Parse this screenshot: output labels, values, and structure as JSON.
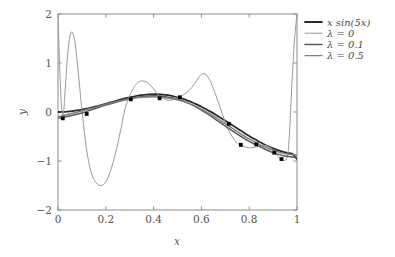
{
  "chart_data": {
    "type": "line",
    "title": "",
    "xlabel": "x",
    "ylabel": "y",
    "xlim": [
      0,
      1
    ],
    "ylim": [
      -2,
      2
    ],
    "xticks": [
      0,
      0.2,
      0.4,
      0.6,
      0.8,
      1
    ],
    "xticklabels": [
      "0",
      "0.2",
      "0.4",
      "0.6",
      "0.8",
      "1"
    ],
    "yticks": [
      -2,
      -1,
      0,
      1,
      2
    ],
    "yticklabels": [
      "-2",
      "-1",
      "0",
      "1",
      "2"
    ],
    "grid": false,
    "legend_position": "outside right top",
    "legend_entries": [
      "x sin(5x)",
      "λ = 0",
      "λ = 0.1",
      "λ = 0.5"
    ],
    "series": [
      {
        "name": "x sin(5x)",
        "color": "#2b2b2b",
        "linewidth": 1.8,
        "x": [
          0.0,
          0.02,
          0.04,
          0.06,
          0.08,
          0.1,
          0.12,
          0.14,
          0.16,
          0.18,
          0.2,
          0.22,
          0.24,
          0.26,
          0.28,
          0.3,
          0.32,
          0.34,
          0.36,
          0.38,
          0.4,
          0.42,
          0.44,
          0.46,
          0.48,
          0.5,
          0.52,
          0.54,
          0.56,
          0.58,
          0.6,
          0.62,
          0.64,
          0.66,
          0.68,
          0.7,
          0.72,
          0.74,
          0.76,
          0.78,
          0.8,
          0.82,
          0.84,
          0.86,
          0.88,
          0.9,
          0.92,
          0.94,
          0.96,
          0.98,
          1.0
        ],
        "y": [
          0.0,
          0.002,
          0.008,
          0.018,
          0.031,
          0.048,
          0.068,
          0.09,
          0.114,
          0.14,
          0.168,
          0.196,
          0.224,
          0.251,
          0.277,
          0.3,
          0.321,
          0.338,
          0.351,
          0.359,
          0.363,
          0.362,
          0.355,
          0.343,
          0.326,
          0.3,
          0.272,
          0.238,
          0.199,
          0.156,
          0.108,
          0.057,
          0.002,
          -0.056,
          -0.116,
          -0.177,
          -0.24,
          -0.303,
          -0.366,
          -0.428,
          -0.488,
          -0.546,
          -0.601,
          -0.652,
          -0.699,
          -0.741,
          -0.778,
          -0.809,
          -0.834,
          -0.852,
          -0.959
        ]
      },
      {
        "name": "λ = 0",
        "color": "#9a9a9a",
        "linewidth": 1.0,
        "x": [
          0.0,
          0.01,
          0.02,
          0.03,
          0.04,
          0.05,
          0.06,
          0.07,
          0.08,
          0.09,
          0.1,
          0.12,
          0.14,
          0.16,
          0.18,
          0.2,
          0.22,
          0.24,
          0.26,
          0.28,
          0.3,
          0.32,
          0.34,
          0.36,
          0.38,
          0.4,
          0.42,
          0.44,
          0.46,
          0.48,
          0.5,
          0.52,
          0.54,
          0.56,
          0.58,
          0.6,
          0.62,
          0.64,
          0.66,
          0.68,
          0.7,
          0.72,
          0.74,
          0.76,
          0.78,
          0.8,
          0.82,
          0.84,
          0.86,
          0.88,
          0.9,
          0.92,
          0.94,
          0.96,
          0.97,
          0.98,
          0.99,
          1.0
        ],
        "y": [
          2.0,
          0.55,
          -0.12,
          0.45,
          1.15,
          1.55,
          1.63,
          1.45,
          1.05,
          0.55,
          0.05,
          -0.78,
          -1.25,
          -1.45,
          -1.5,
          -1.43,
          -1.2,
          -0.85,
          -0.42,
          0.05,
          0.33,
          0.52,
          0.62,
          0.63,
          0.58,
          0.47,
          0.35,
          0.28,
          0.24,
          0.25,
          0.29,
          0.34,
          0.4,
          0.5,
          0.64,
          0.77,
          0.76,
          0.6,
          0.35,
          0.07,
          -0.22,
          -0.43,
          -0.58,
          -0.67,
          -0.71,
          -0.73,
          -0.72,
          -0.7,
          -0.68,
          -0.7,
          -0.78,
          -0.9,
          -0.99,
          -0.9,
          -0.3,
          0.7,
          1.5,
          2.0
        ]
      },
      {
        "name": "λ = 0.1",
        "color": "#5c5c5c",
        "linewidth": 1.5,
        "x": [
          0.0,
          0.05,
          0.1,
          0.15,
          0.2,
          0.25,
          0.3,
          0.35,
          0.4,
          0.45,
          0.5,
          0.55,
          0.6,
          0.65,
          0.7,
          0.75,
          0.8,
          0.85,
          0.9,
          0.95,
          1.0
        ],
        "y": [
          -0.13,
          -0.08,
          -0.02,
          0.06,
          0.14,
          0.21,
          0.27,
          0.31,
          0.33,
          0.31,
          0.26,
          0.17,
          0.04,
          -0.12,
          -0.29,
          -0.45,
          -0.6,
          -0.72,
          -0.83,
          -0.9,
          -0.93
        ]
      },
      {
        "name": "λ = 0.5",
        "color": "#7d7d7d",
        "linewidth": 1.4,
        "x": [
          0.0,
          0.05,
          0.1,
          0.15,
          0.2,
          0.25,
          0.3,
          0.35,
          0.4,
          0.45,
          0.5,
          0.55,
          0.6,
          0.65,
          0.7,
          0.75,
          0.8,
          0.85,
          0.9,
          0.95,
          1.0
        ],
        "y": [
          -0.1,
          -0.04,
          0.02,
          0.09,
          0.16,
          0.22,
          0.27,
          0.3,
          0.31,
          0.29,
          0.25,
          0.17,
          0.06,
          -0.08,
          -0.24,
          -0.4,
          -0.55,
          -0.68,
          -0.78,
          -0.85,
          -0.88
        ]
      }
    ],
    "scatter": {
      "name": "data-points",
      "color": "#000000",
      "marker": "square",
      "size": 3,
      "x": [
        0.02,
        0.12,
        0.305,
        0.425,
        0.51,
        0.715,
        0.765,
        0.83,
        0.905,
        0.935
      ],
      "y": [
        -0.13,
        -0.04,
        0.26,
        0.28,
        0.3,
        -0.24,
        -0.67,
        -0.66,
        -0.83,
        -0.96
      ]
    }
  }
}
